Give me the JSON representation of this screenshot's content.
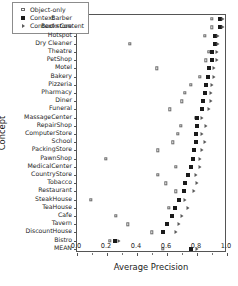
{
  "chart_data": {
    "type": "scatter",
    "title": "",
    "xlabel": "Average Precision",
    "ylabel": "Concept",
    "xlim": [
      0.0,
      1.0
    ],
    "xticks": [
      0.0,
      0.2,
      0.4,
      0.6,
      0.8,
      1.0
    ],
    "xticklabels": [
      "0.0",
      "0.2",
      "0.4",
      "0.6",
      "0.8",
      "1.0"
    ],
    "grid": false,
    "legend_position": "upper left",
    "categories": [
      "Barber",
      "Bookstore",
      "Hotspot",
      "Dry Cleaner",
      "Theatre",
      "PetShop",
      "Motel",
      "Bakery",
      "Pizzeria",
      "Pharmacy",
      "Diner",
      "Funeral",
      "MassageCenter",
      "RepairShop",
      "ComputerStore",
      "School",
      "PackingStore",
      "PawnShop",
      "MedicalCenter",
      "CountryStore",
      "Tobacco",
      "Restaurant",
      "SteakHouse",
      "TeaHouse",
      "Cafe",
      "Tavern",
      "DiscountHouse",
      "Bistro",
      "MEAN"
    ],
    "series": [
      {
        "name": "Object-only",
        "marker": "open-square",
        "color": "#6a6a6a",
        "values": [
          0.9,
          0.9,
          0.85,
          0.35,
          0.88,
          0.86,
          0.53,
          0.82,
          0.76,
          0.72,
          0.7,
          0.62,
          0.79,
          0.69,
          0.67,
          0.64,
          0.54,
          0.19,
          0.66,
          0.54,
          0.59,
          0.66,
          0.09,
          0.61,
          0.26,
          0.34,
          0.5,
          0.22,
          0.57
        ]
      },
      {
        "name": "Context",
        "marker": "filled-square",
        "color": "#1a1a1a",
        "values": [
          0.95,
          0.95,
          0.92,
          0.92,
          0.9,
          0.9,
          0.88,
          0.87,
          0.86,
          0.85,
          0.84,
          0.83,
          0.8,
          0.8,
          0.79,
          0.79,
          0.78,
          0.77,
          0.76,
          0.74,
          0.72,
          0.71,
          0.68,
          0.65,
          0.63,
          0.6,
          0.57,
          0.25,
          0.76
        ]
      },
      {
        "name": "Context+Content",
        "marker": "right-triangle",
        "color": "#5a5a5a",
        "values": [
          0.97,
          0.97,
          0.94,
          0.94,
          0.93,
          0.93,
          0.91,
          0.91,
          0.9,
          0.89,
          0.89,
          0.88,
          0.83,
          0.86,
          0.83,
          0.85,
          0.83,
          0.82,
          0.82,
          0.79,
          0.8,
          0.78,
          0.72,
          0.74,
          0.7,
          0.68,
          0.66,
          0.28,
          0.8
        ]
      }
    ]
  },
  "legend": {
    "entries": [
      {
        "label": "Object-only"
      },
      {
        "label": "Context"
      },
      {
        "label": "Context+Content"
      }
    ]
  }
}
